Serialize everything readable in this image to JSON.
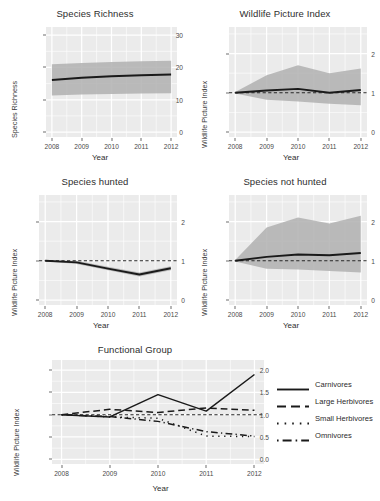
{
  "figure": {
    "background": "#ffffff",
    "panel_background": "#ebebeb",
    "grid_color": "#ffffff",
    "line_color": "#1a1a1a",
    "ribbon_color": "#b0b0b0"
  },
  "panels": [
    {
      "id": "species-richness",
      "title": "Species Richness",
      "xlabel": "Year",
      "ylabel": "Species Richness"
    },
    {
      "id": "wildlife-picture-index",
      "title": "Wildlife Picture Index",
      "xlabel": "Year",
      "ylabel": "Wildlife Picture Index"
    },
    {
      "id": "species-hunted",
      "title": "Species hunted",
      "xlabel": "Year",
      "ylabel": "Wildlife Picture Index"
    },
    {
      "id": "species-not-hunted",
      "title": "Species not hunted",
      "xlabel": "Year",
      "ylabel": "Wildlife Picture Index"
    },
    {
      "id": "functional-group",
      "title": "Functional Group",
      "xlabel": "Year",
      "ylabel": "Wildlife Picture Index"
    }
  ],
  "chart_data": [
    {
      "type": "line",
      "id": "species-richness",
      "title": "Species Richness",
      "xlabel": "Year",
      "ylabel": "Species Richness",
      "x": [
        2008,
        2009,
        2010,
        2011,
        2012
      ],
      "xticks": [
        "2008",
        "2009",
        "2010",
        "2011",
        "2012"
      ],
      "yticks": [
        "0",
        "10",
        "20",
        "30"
      ],
      "xlim": [
        2008,
        2012
      ],
      "ylim": [
        0,
        31
      ],
      "grid": true,
      "legend": "none",
      "series": [
        {
          "name": "Species Richness",
          "style": "solid",
          "values": [
            16.1,
            16.8,
            17.3,
            17.6,
            17.8
          ]
        }
      ],
      "ribbon": {
        "name": "confidence band",
        "upper": [
          21.0,
          21.4,
          21.7,
          21.9,
          22.1
        ],
        "lower": [
          11.3,
          11.6,
          11.8,
          11.9,
          12.0
        ]
      }
    },
    {
      "type": "line",
      "id": "wildlife-picture-index",
      "title": "Wildlife Picture Index",
      "xlabel": "Year",
      "ylabel": "Wildlife Picture Index",
      "x": [
        2008,
        2009,
        2010,
        2011,
        2012
      ],
      "xticks": [
        "2008",
        "2009",
        "2010",
        "2011",
        "2012"
      ],
      "yticks": [
        "0",
        "1",
        "2"
      ],
      "xlim": [
        2008,
        2012
      ],
      "ylim": [
        0,
        2.55
      ],
      "grid": true,
      "legend": "none",
      "reference_line": {
        "value": 1.0,
        "style": "dashed"
      },
      "series": [
        {
          "name": "Wildlife Picture Index",
          "style": "solid",
          "values": [
            1.0,
            1.06,
            1.1,
            1.0,
            1.07
          ]
        }
      ],
      "ribbon": {
        "name": "confidence band",
        "upper": [
          1.02,
          1.45,
          1.7,
          1.5,
          1.62
        ],
        "lower": [
          0.98,
          0.82,
          0.78,
          0.72,
          0.68
        ]
      }
    },
    {
      "type": "line",
      "id": "species-hunted",
      "title": "Species hunted",
      "xlabel": "Year",
      "ylabel": "Wildlife Picture Index",
      "x": [
        2008,
        2009,
        2010,
        2011,
        2012
      ],
      "xticks": [
        "2008",
        "2009",
        "2010",
        "2011",
        "2012"
      ],
      "yticks": [
        "0",
        "1",
        "2"
      ],
      "xlim": [
        2008,
        2012
      ],
      "ylim": [
        0,
        2.55
      ],
      "grid": true,
      "legend": "none",
      "reference_line": {
        "value": 1.0,
        "style": "dashed"
      },
      "series": [
        {
          "name": "Species hunted",
          "style": "solid",
          "values": [
            1.0,
            0.96,
            0.8,
            0.65,
            0.81
          ]
        }
      ],
      "ribbon": {
        "name": "confidence band",
        "upper": [
          1.01,
          1.0,
          0.85,
          0.7,
          0.86
        ],
        "lower": [
          0.99,
          0.92,
          0.76,
          0.6,
          0.76
        ]
      }
    },
    {
      "type": "line",
      "id": "species-not-hunted",
      "title": "Species not hunted",
      "xlabel": "Year",
      "ylabel": "Wildlife Picture Index",
      "x": [
        2008,
        2009,
        2010,
        2011,
        2012
      ],
      "xticks": [
        "2008",
        "2009",
        "2010",
        "2011",
        "2012"
      ],
      "yticks": [
        "0",
        "1",
        "2"
      ],
      "xlim": [
        2008,
        2012
      ],
      "ylim": [
        0,
        2.55
      ],
      "grid": true,
      "legend": "none",
      "reference_line": {
        "value": 1.0,
        "style": "dashed"
      },
      "series": [
        {
          "name": "Species not hunted",
          "style": "solid",
          "values": [
            1.0,
            1.1,
            1.16,
            1.14,
            1.2
          ]
        }
      ],
      "ribbon": {
        "name": "confidence band",
        "upper": [
          1.02,
          1.85,
          2.1,
          1.95,
          2.15
        ],
        "lower": [
          0.98,
          0.8,
          0.78,
          0.74,
          0.7
        ]
      }
    },
    {
      "type": "line",
      "id": "functional-group",
      "title": "Functional Group",
      "xlabel": "Year",
      "ylabel": "Wildlife Picture Index",
      "x": [
        2008,
        2009,
        2010,
        2011,
        2012
      ],
      "xticks": [
        "2008",
        "2009",
        "2010",
        "2011",
        "2012"
      ],
      "yticks": [
        "0.0",
        "0.5",
        "1.0",
        "1.5",
        "2.0"
      ],
      "xlim": [
        2008,
        2012
      ],
      "ylim": [
        0.0,
        2.12
      ],
      "grid": true,
      "legend": "right",
      "reference_line": {
        "value": 1.0,
        "style": "dashed"
      },
      "series": [
        {
          "name": "Carnivores",
          "style": "solid",
          "values": [
            1.0,
            0.95,
            1.45,
            1.08,
            1.9
          ]
        },
        {
          "name": "Large Herbivores",
          "style": "dashed",
          "values": [
            1.0,
            1.12,
            1.05,
            1.15,
            1.1
          ]
        },
        {
          "name": "Small Herbivores",
          "style": "dotted",
          "values": [
            1.0,
            0.95,
            0.92,
            0.52,
            0.51
          ]
        },
        {
          "name": "Omnivores",
          "style": "dashdot",
          "values": [
            1.0,
            0.96,
            0.85,
            0.62,
            0.52
          ]
        }
      ]
    }
  ],
  "legend": {
    "items": [
      {
        "label": "Carnivores",
        "style": "solid"
      },
      {
        "label": "Large Herbivores",
        "style": "dashed"
      },
      {
        "label": "Small Herbivores",
        "style": "dotted"
      },
      {
        "label": "Omnivores",
        "style": "dashdot"
      }
    ]
  }
}
